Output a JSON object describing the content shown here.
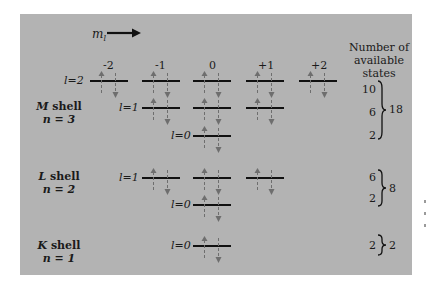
{
  "diagram": {
    "ml_axis_label": "m",
    "ml_axis_subscript": "l",
    "ml_values": [
      "-2",
      "-1",
      "0",
      "+1",
      "+2"
    ],
    "header_right": [
      "Number of",
      "available",
      "states"
    ],
    "shells": [
      {
        "name": "M shell",
        "letter": "M",
        "word": "shell",
        "n_label": "n = 3",
        "subshells": [
          {
            "label": "l = 2",
            "text": "l=2",
            "ml": [
              "-2",
              "-1",
              "0",
              "+1",
              "+2"
            ],
            "states": "10"
          },
          {
            "label": "l = 1",
            "text": "l=1",
            "ml": [
              "-1",
              "0",
              "+1"
            ],
            "states": "6"
          },
          {
            "label": "l = 0",
            "text": "l=0",
            "ml": [
              "0"
            ],
            "states": "2"
          }
        ],
        "total": "18"
      },
      {
        "name": "L shell",
        "letter": "L",
        "word": "shell",
        "n_label": "n = 2",
        "subshells": [
          {
            "label": "l = 1",
            "text": "l=1",
            "ml": [
              "-1",
              "0",
              "+1"
            ],
            "states": "6"
          },
          {
            "label": "l = 0",
            "text": "l=0",
            "ml": [
              "0"
            ],
            "states": "2"
          }
        ],
        "total": "8"
      },
      {
        "name": "K shell",
        "letter": "K",
        "word": "shell",
        "n_label": "n = 1",
        "subshells": [
          {
            "label": "l = 0",
            "text": "l=0",
            "ml": [
              "0"
            ],
            "states": "2"
          }
        ],
        "total": "2"
      }
    ],
    "colors": {
      "panel_background": "#b3b3b3",
      "level_line": "#111111",
      "spin_arrow": "#6e6e6e"
    }
  }
}
